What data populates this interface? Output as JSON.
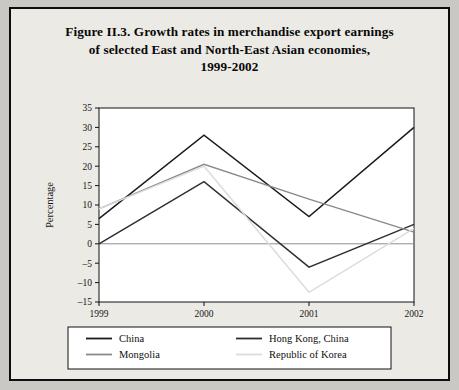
{
  "figure": {
    "title_line1": "Figure II.3.  Growth rates in merchandise export earnings",
    "title_line2": "of selected East and North-East Asian economies,",
    "title_line3": "1999-2002"
  },
  "chart_data": {
    "type": "line",
    "title": "Figure II.3.  Growth rates in merchandise export earnings of selected East and North-East Asian economies, 1999-2002",
    "xlabel": "",
    "ylabel": "Percentage",
    "categories": [
      "1999",
      "2000",
      "2001",
      "2002"
    ],
    "x": [
      1999,
      2000,
      2001,
      2002
    ],
    "ylim": [
      -15,
      35
    ],
    "yticks": [
      -15,
      -10,
      -5,
      0,
      5,
      10,
      15,
      20,
      25,
      30,
      35
    ],
    "ytick_labels": [
      "–15",
      "–10",
      "–5",
      "0",
      "5",
      "10",
      "15",
      "20",
      "25",
      "30",
      "35"
    ],
    "grid": false,
    "legend_position": "bottom",
    "series": [
      {
        "name": "China",
        "color": "#1a1a1a",
        "values": [
          6.5,
          28,
          7,
          30
        ]
      },
      {
        "name": "Hong Kong, China",
        "color": "#2e2e2e",
        "values": [
          0,
          16,
          -6,
          5
        ]
      },
      {
        "name": "Mongolia",
        "color": "#8a8a8a",
        "values": [
          9,
          20.5,
          11.5,
          3
        ]
      },
      {
        "name": "Republic of Korea",
        "color": "#dcdcdc",
        "values": [
          9,
          20,
          -12.5,
          4
        ]
      }
    ]
  },
  "legend": {
    "items": [
      {
        "label": "China"
      },
      {
        "label": "Hong Kong, China"
      },
      {
        "label": "Mongolia"
      },
      {
        "label": "Republic of Korea"
      }
    ]
  },
  "colors": {
    "page_background": "#c9c8c4",
    "figure_background": "#eceae5",
    "plot_background": "#ffffff",
    "frame": "#0d0d0d"
  }
}
